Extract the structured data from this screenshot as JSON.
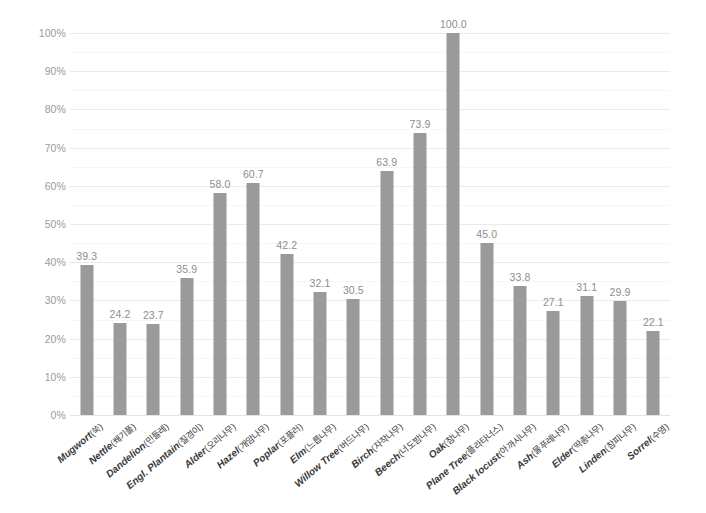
{
  "chart_data": {
    "type": "bar",
    "title": "",
    "subtitle": "",
    "xlabel": "",
    "ylabel": "",
    "ylim": [
      0,
      100
    ],
    "y_tick_labels": [
      "0%",
      "10%",
      "20%",
      "30%",
      "40%",
      "50%",
      "60%",
      "70%",
      "80%",
      "90%",
      "100%"
    ],
    "y_tick_values": [
      0,
      10,
      20,
      30,
      40,
      50,
      60,
      70,
      80,
      90,
      100
    ],
    "minor_gridline_values": [
      5,
      15,
      25,
      35,
      45,
      55,
      65,
      75,
      85,
      95
    ],
    "grid": true,
    "legend": "none",
    "bar_color": "#9a9a9a",
    "value_label_color": "#8e8e8e",
    "axis_label_color": "#9b9b9b",
    "gridline_color": "#f0f0f0",
    "background_color": "#ffffff",
    "categories": [
      "Mugwort(쑥)",
      "Nettle(쐐기풀)",
      "Dandelion(민들레)",
      "Engl. Plantain(질경이)",
      "Alder(오리나무)",
      "Hazel(개암나무)",
      "Poplar(포플러)",
      "Elm(느릅나무)",
      "Willow Tree(버드나무)",
      "Birch(자작나무)",
      "Beech(너도밤나무)",
      "Oak(참나무)",
      "Plane Tree(플라타너스)",
      "Black locust(아까시나무)",
      "Ash(물푸레나무)",
      "Elder(딱총나무)",
      "Linden(참피나무)",
      "Sorrel(수영)"
    ],
    "categories_split": [
      {
        "sci": "Mugwort",
        "kor": "(쑥)"
      },
      {
        "sci": "Nettle",
        "kor": "(쐐기풀)"
      },
      {
        "sci": "Dandelion",
        "kor": "(민들레)"
      },
      {
        "sci": "Engl. Plantain",
        "kor": "(질경이)"
      },
      {
        "sci": "Alder",
        "kor": "(오리나무)"
      },
      {
        "sci": "Hazel",
        "kor": "(개암나무)"
      },
      {
        "sci": "Poplar",
        "kor": "(포플러)"
      },
      {
        "sci": "Elm",
        "kor": "(느릅나무)"
      },
      {
        "sci": "Willow Tree",
        "kor": "(버드나무)"
      },
      {
        "sci": "Birch",
        "kor": "(자작나무)"
      },
      {
        "sci": "Beech",
        "kor": "(너도밤나무)"
      },
      {
        "sci": "Oak",
        "kor": "(참나무)"
      },
      {
        "sci": "Plane Tree",
        "kor": "(플라타너스)"
      },
      {
        "sci": "Black locust",
        "kor": "(아까시나무)"
      },
      {
        "sci": "Ash",
        "kor": "(물푸레나무)"
      },
      {
        "sci": "Elder",
        "kor": "(딱총나무)"
      },
      {
        "sci": "Linden",
        "kor": "(참피나무)"
      },
      {
        "sci": "Sorrel",
        "kor": "(수영)"
      }
    ],
    "values": [
      39.3,
      24.2,
      23.7,
      35.9,
      58.0,
      60.7,
      42.2,
      32.1,
      30.5,
      63.9,
      73.9,
      100.0,
      45.0,
      33.8,
      27.1,
      31.1,
      29.9,
      22.1
    ],
    "value_labels": [
      "39.3",
      "24.2",
      "23.7",
      "35.9",
      "58.0",
      "60.7",
      "42.2",
      "32.1",
      "30.5",
      "63.9",
      "73.9",
      "100.0",
      "45.0",
      "33.8",
      "27.1",
      "31.1",
      "29.9",
      "22.1"
    ]
  }
}
